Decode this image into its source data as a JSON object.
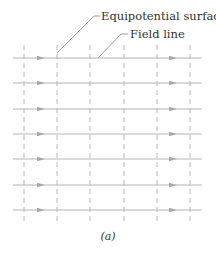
{
  "figure": {
    "caption": "(a)",
    "labels": {
      "equipotential": "Equipotential surface",
      "field_line": "Field line"
    },
    "colors": {
      "field_line": "#b4b4b4",
      "arrow": "#a8a8a8",
      "equipotential": "#b8b8b8",
      "leader": "#777777",
      "text": "#333333"
    },
    "field_lines": {
      "y": [
        58,
        83,
        109,
        134,
        159,
        185,
        210
      ],
      "x_start": 13,
      "x_end": 202,
      "arrow_x": [
        41,
        173
      ]
    },
    "equipotentials": {
      "x": [
        24,
        57,
        90,
        124,
        157,
        190
      ],
      "y_start": 45,
      "y_end": 223
    }
  }
}
